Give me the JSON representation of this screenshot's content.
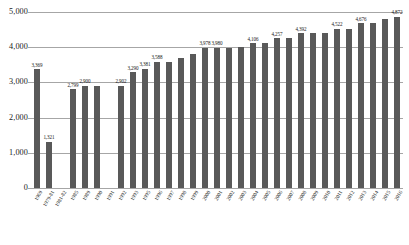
{
  "chart_data": {
    "type": "bar",
    "title": "",
    "subtitle": "",
    "xlabel": "",
    "ylabel": "",
    "ylim": [
      0,
      5000
    ],
    "yticks": [
      0,
      1000,
      2000,
      3000,
      4000,
      5000
    ],
    "ytick_labels": [
      "0",
      "1,000",
      "2,000",
      "3,000",
      "4,000",
      "5,000"
    ],
    "grid": true,
    "legend": "none",
    "bar_color": "#595959",
    "gridline_color": "#a6a6a6",
    "categories": [
      "1969",
      "1979-81",
      "1981-82",
      "1985",
      "1989",
      "1990",
      "1991",
      "1992",
      "1993",
      "1995",
      "1996",
      "1997",
      "1998",
      "1999",
      "2000",
      "2001",
      "2002",
      "2003",
      "2004",
      "2005",
      "2006",
      "2007",
      "2008",
      "2009",
      "2010",
      "2011",
      "2012",
      "2013",
      "2014",
      "2015",
      "2016"
    ],
    "values": [
      3369,
      1321,
      null,
      2799,
      2900,
      2900,
      null,
      2902,
      3290,
      3381,
      3588,
      3588,
      3700,
      3820,
      3978,
      3980,
      3980,
      4000,
      4106,
      4106,
      4257,
      4257,
      4392,
      4392,
      4392,
      4522,
      4522,
      4676,
      4676,
      4800,
      4872
    ],
    "labeled_values": [
      "3,369",
      "1,321",
      "",
      "2,799",
      "2,900",
      "",
      "",
      "2,902",
      "3,290",
      "3,381",
      "3,588",
      "",
      "",
      "",
      "3,978",
      "3,980",
      "",
      "",
      "4,106",
      "",
      "4,257",
      "",
      "4,392",
      "",
      "",
      "4,522",
      "",
      "4,676",
      "",
      "",
      "4,872"
    ]
  }
}
